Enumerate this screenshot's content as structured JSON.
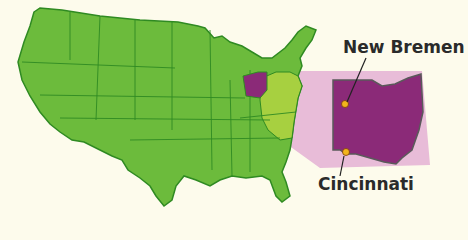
{
  "map": {
    "title": "United States with Ohio highlighted",
    "highlighted_state": "Ohio",
    "colors": {
      "background": "#fdfbec",
      "land": "#6cbb3c",
      "land_east": "#a7d040",
      "border": "#2f8a22",
      "highlight": "#8b2a78",
      "callout": "#e8bcd8",
      "city_dot": "#f2b51c"
    },
    "cities": [
      {
        "name": "New Bremen",
        "label": "New Bremen"
      },
      {
        "name": "Cincinnati",
        "label": "Cincinnati"
      }
    ]
  }
}
